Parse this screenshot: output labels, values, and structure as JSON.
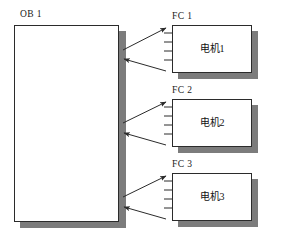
{
  "diagram": {
    "colors": {
      "outline": "#2b2b2b",
      "shadow": "#7c7c7c",
      "fill": "#ffffff",
      "text": "#111111"
    },
    "caller": {
      "label": "OB 1",
      "name": "ob-block"
    },
    "callees": [
      {
        "label": "FC 1",
        "body_text": "电机1",
        "name": "fc1-block",
        "pin_count": 4
      },
      {
        "label": "FC 2",
        "body_text": "电机2",
        "name": "fc2-block",
        "pin_count": 4
      },
      {
        "label": "FC 3",
        "body_text": "电机3",
        "name": "fc3-block",
        "pin_count": 4
      }
    ],
    "connections": [
      {
        "name": "call-arrow-fc1",
        "from": "ob-block",
        "to": "fc1-block",
        "direction": "right"
      },
      {
        "name": "return-arrow-fc1",
        "from": "fc1-block",
        "to": "ob-block",
        "direction": "left"
      },
      {
        "name": "call-arrow-fc2",
        "from": "ob-block",
        "to": "fc2-block",
        "direction": "right"
      },
      {
        "name": "return-arrow-fc2",
        "from": "fc2-block",
        "to": "ob-block",
        "direction": "left"
      },
      {
        "name": "call-arrow-fc3",
        "from": "ob-block",
        "to": "fc3-block",
        "direction": "right"
      },
      {
        "name": "return-arrow-fc3",
        "from": "fc3-block",
        "to": "ob-block",
        "direction": "left"
      }
    ]
  }
}
